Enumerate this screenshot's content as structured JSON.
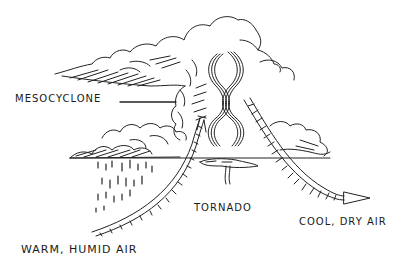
{
  "diagram": {
    "labels": {
      "mesocyclone": "MESOCYCLONE",
      "tornado": "TORNADO",
      "cool_air": "COOL, DRY AIR",
      "warm_air": "WARM, HUMID AIR"
    },
    "colors": {
      "ink": "#1a1a1a",
      "background": "#ffffff"
    }
  }
}
